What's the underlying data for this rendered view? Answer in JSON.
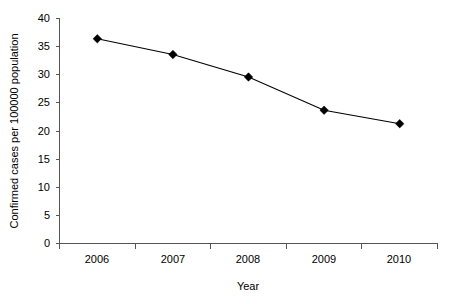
{
  "chart_data": {
    "type": "line",
    "title": "",
    "subtitle": "",
    "xlabel": "Year",
    "ylabel": "Confirmed cases per 100000 population",
    "categories": [
      "2006",
      "2007",
      "2008",
      "2009",
      "2010"
    ],
    "values": [
      36.4,
      33.6,
      29.6,
      23.7,
      21.3
    ],
    "series": [
      {
        "name": "Confirmed cases per 100000 population",
        "values": [
          36.4,
          33.6,
          29.6,
          23.7,
          21.3
        ]
      }
    ],
    "ylim": [
      0,
      40
    ],
    "ytick_labels": [
      "0",
      "5",
      "10",
      "15",
      "20",
      "25",
      "30",
      "35",
      "40"
    ],
    "ytick_values": [
      0,
      5,
      10,
      15,
      20,
      25,
      30,
      35,
      40
    ],
    "xtick_labels": [
      "2006",
      "2007",
      "2008",
      "2009",
      "2010"
    ],
    "grid": false,
    "legend": false,
    "legend_position": "none",
    "marker": "diamond",
    "line_color": "#000000",
    "marker_color": "#000000",
    "axis_color": "#555555",
    "background_color": "#ffffff"
  }
}
